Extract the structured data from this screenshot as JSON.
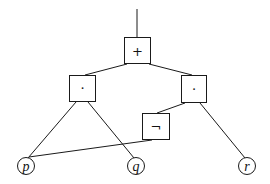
{
  "diagram": {
    "type": "expression-tree",
    "nodes": [
      {
        "id": "plus",
        "label": "+",
        "shape": "box",
        "x": 137,
        "y": 51
      },
      {
        "id": "and-left",
        "label": "·",
        "shape": "box",
        "x": 82,
        "y": 88
      },
      {
        "id": "and-right",
        "label": "·",
        "shape": "box",
        "x": 193,
        "y": 89
      },
      {
        "id": "not",
        "label": "¬",
        "shape": "box",
        "x": 156,
        "y": 126
      },
      {
        "id": "p",
        "label": "p",
        "shape": "circle",
        "x": 26,
        "y": 166
      },
      {
        "id": "q",
        "label": "q",
        "shape": "circle",
        "x": 136,
        "y": 166
      },
      {
        "id": "r",
        "label": "r",
        "shape": "circle",
        "x": 247,
        "y": 166
      }
    ],
    "edges": [
      {
        "from": "output",
        "to": "plus"
      },
      {
        "from": "plus",
        "to": "and-left"
      },
      {
        "from": "plus",
        "to": "and-right"
      },
      {
        "from": "and-left",
        "to": "p"
      },
      {
        "from": "and-left",
        "to": "q"
      },
      {
        "from": "and-right",
        "to": "not"
      },
      {
        "from": "and-right",
        "to": "r"
      },
      {
        "from": "not",
        "to": "p"
      }
    ],
    "labels": {
      "plus": "+",
      "and_left": "·",
      "and_right": "·",
      "not": "¬",
      "p": "p",
      "q": "q",
      "r": "r"
    },
    "colors": {
      "stroke": "#1a1a1a",
      "background": "#ffffff"
    }
  }
}
